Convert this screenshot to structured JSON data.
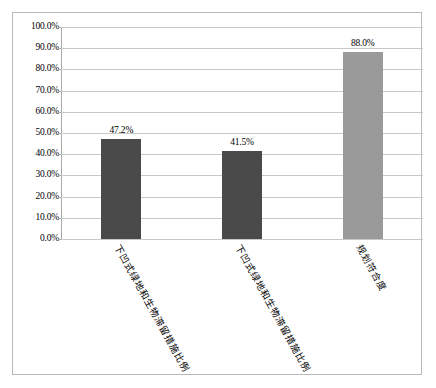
{
  "chart_data": {
    "type": "bar",
    "title": "",
    "subtitle": "",
    "xlabel": "",
    "ylabel": "",
    "ylim": [
      0,
      1
    ],
    "grid": true,
    "legend": "none",
    "categories": [
      "下凹式绿地和生物滞留措施比例",
      "下凹式绿地和生物滞留措施比例",
      "规划符合度"
    ],
    "values": [
      0.472,
      0.415,
      0.88
    ],
    "value_labels": [
      "47.2%",
      "41.5%",
      "88.0%"
    ],
    "bar_colors": [
      "#4a4a4a",
      "#4a4a4a",
      "#9a9a9a"
    ],
    "ytick_labels": [
      "100.0%",
      "90.0%",
      "80.0%",
      "70.0%",
      "60.0%",
      "50.0%",
      "40.0%",
      "30.0%",
      "20.0%",
      "10.0%",
      "0.0%"
    ],
    "ytick_values": [
      1,
      0.9,
      0.8,
      0.7,
      0.6,
      0.5,
      0.4,
      0.3,
      0.2,
      0.1,
      0
    ]
  },
  "style": {
    "frame_border_color": "#b9b9b9",
    "gridline_color": "#c8c8c8",
    "axis_color": "#aaaaaa",
    "background": "#ffffff",
    "text_color": "#000000"
  }
}
